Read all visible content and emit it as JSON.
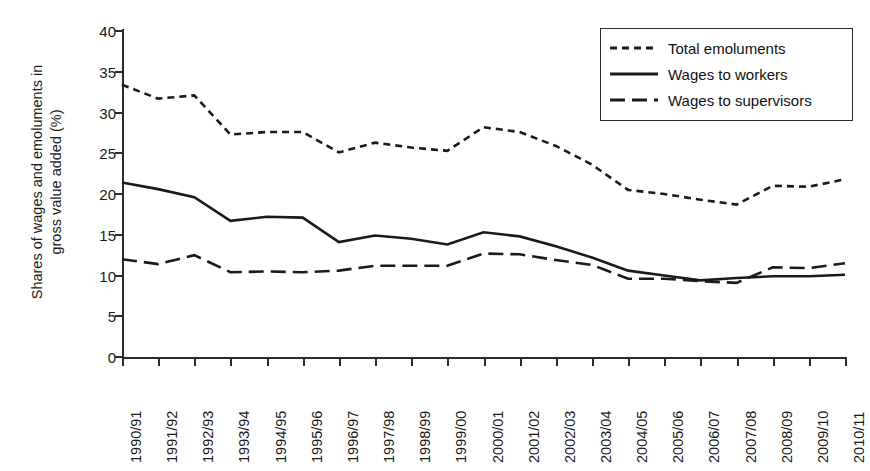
{
  "chart_data": {
    "type": "line",
    "title": "",
    "xlabel": "",
    "ylabel": "Shares of wages and emoluments in\ngross value added (%)",
    "ylim": [
      0,
      40
    ],
    "ytick_step": 5,
    "yticks": [
      "0",
      "5",
      "10",
      "15",
      "20",
      "25",
      "30",
      "35",
      "40"
    ],
    "grid": false,
    "legend_position": "top-right",
    "categories": [
      "1990/91",
      "1991/92",
      "1992/93",
      "1993/94",
      "1994/95",
      "1995/96",
      "1996/97",
      "1997/98",
      "1998/99",
      "1999/00",
      "2000/01",
      "2001/02",
      "2002/03",
      "2003/04",
      "2004/05",
      "2005/06",
      "2006/07",
      "2007/08",
      "2008/09",
      "2009/10",
      "2010/11"
    ],
    "series": [
      {
        "name": "Total emoluments",
        "style": "short-dash",
        "values": [
          33.4,
          31.7,
          32.1,
          27.3,
          27.6,
          27.6,
          25.1,
          26.3,
          25.7,
          25.3,
          28.2,
          27.6,
          25.9,
          23.6,
          20.5,
          20.0,
          19.3,
          18.7,
          21.0,
          20.9,
          21.8
        ]
      },
      {
        "name": "Wages to workers",
        "style": "solid",
        "values": [
          21.4,
          20.6,
          19.6,
          16.7,
          17.2,
          17.1,
          14.1,
          14.9,
          14.5,
          13.8,
          15.3,
          14.8,
          13.6,
          12.2,
          10.6,
          10.0,
          9.4,
          9.7,
          9.9,
          9.9,
          10.1
        ]
      },
      {
        "name": "Wages to supervisors",
        "style": "long-dash",
        "values": [
          12.0,
          11.4,
          12.5,
          10.4,
          10.5,
          10.4,
          10.6,
          11.2,
          11.2,
          11.2,
          12.7,
          12.6,
          11.9,
          11.3,
          9.6,
          9.6,
          9.3,
          9.1,
          11.0,
          10.9,
          11.5
        ]
      }
    ]
  },
  "legend": {
    "items": [
      {
        "label": "Total emoluments"
      },
      {
        "label": "Wages to workers"
      },
      {
        "label": "Wages to supervisors"
      }
    ]
  },
  "colors": {
    "line": "#1a1a1a",
    "axis": "#2b2b2b",
    "background": "#ffffff"
  }
}
